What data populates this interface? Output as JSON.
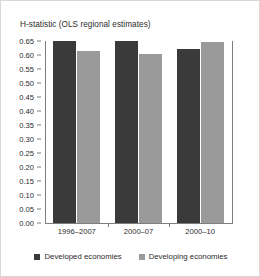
{
  "chart_data": {
    "type": "bar",
    "title": "H-statistic (OLS regional estimates)",
    "xlabel": "",
    "ylabel": "",
    "categories": [
      "1996–2007",
      "2000–07",
      "2000–10"
    ],
    "series": [
      {
        "name": "Developed economies",
        "color": "#3a3a3a",
        "values": [
          0.65,
          0.65,
          0.62
        ]
      },
      {
        "name": "Developing economies",
        "color": "#9a9a9a",
        "values": [
          0.615,
          0.605,
          0.645
        ]
      }
    ],
    "ylim": [
      0.0,
      0.65
    ],
    "ytick_step": 0.05,
    "yticks": [
      "0.00",
      "0.05",
      "0.10",
      "0.15",
      "0.20",
      "0.25",
      "0.30",
      "0.35",
      "0.40",
      "0.45",
      "0.50",
      "0.55",
      "0.60",
      "0.65"
    ],
    "ytick_values": [
      0.0,
      0.05,
      0.1,
      0.15,
      0.2,
      0.25,
      0.3,
      0.35,
      0.4,
      0.45,
      0.5,
      0.55,
      0.6,
      0.65
    ],
    "grid": false,
    "legend_position": "bottom-center",
    "axis_color": "#7d7d7d",
    "background": "#ffffff",
    "border_color": "#d8d8d8"
  }
}
